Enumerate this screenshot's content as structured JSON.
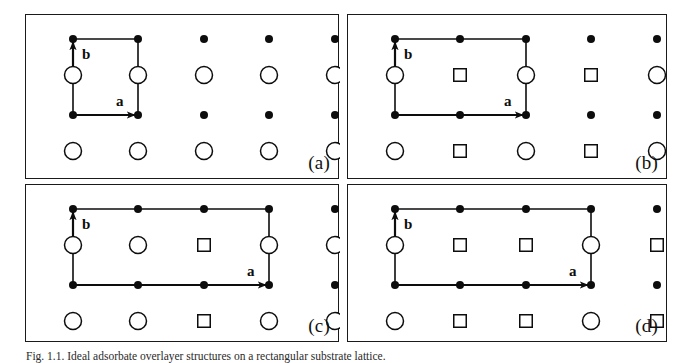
{
  "figure": {
    "caption": "Fig. 1.1. Ideal adsorbate overlayer structures on a rectangular substrate lattice.",
    "background_color": "#ffffff",
    "ink_color": "#111111",
    "panel_border_color": "#1a1a1a"
  },
  "legend_semantics": {
    "filled_dot": "substrate lattice atom",
    "open_circle": "adsorbate site type A",
    "open_square": "adsorbate site type B"
  },
  "lattice": {
    "columns": 5,
    "rows": 5,
    "row_types": [
      "dot",
      "site",
      "dot",
      "site",
      "dot"
    ],
    "x_positions": [
      47,
      112,
      178,
      243,
      309
    ],
    "y_positions": [
      24,
      60,
      100,
      136,
      170
    ],
    "dot_radius": 4.0,
    "circle_radius": 8.5,
    "square_size": 12.5
  },
  "vectors": {
    "a_label": "a",
    "b_label": "b"
  },
  "panels": [
    {
      "id": "a",
      "label": "(a)",
      "cell_cols": 1,
      "site_row_upper": [
        "circle",
        "circle",
        "circle",
        "circle",
        "circle"
      ],
      "site_row_lower": [
        "circle",
        "circle",
        "circle",
        "circle",
        "circle"
      ]
    },
    {
      "id": "b",
      "label": "(b)",
      "cell_cols": 2,
      "site_row_upper": [
        "circle",
        "square",
        "circle",
        "square",
        "circle"
      ],
      "site_row_lower": [
        "circle",
        "square",
        "circle",
        "square",
        "circle"
      ]
    },
    {
      "id": "c",
      "label": "(c)",
      "cell_cols": 3,
      "site_row_upper": [
        "circle",
        "circle",
        "square",
        "circle",
        "circle"
      ],
      "site_row_lower": [
        "circle",
        "circle",
        "square",
        "circle",
        "circle"
      ]
    },
    {
      "id": "d",
      "label": "(d)",
      "cell_cols": 3,
      "site_row_upper": [
        "circle",
        "square",
        "square",
        "circle",
        "square"
      ],
      "site_row_lower": [
        "circle",
        "square",
        "square",
        "circle",
        "square"
      ]
    }
  ],
  "panel_geometry": [
    {
      "id": "a",
      "left": 25,
      "top": 14,
      "width": 314,
      "height": 165
    },
    {
      "id": "b",
      "left": 347,
      "top": 14,
      "width": 320,
      "height": 165
    },
    {
      "id": "c",
      "left": 25,
      "top": 184,
      "width": 314,
      "height": 158
    },
    {
      "id": "d",
      "left": 347,
      "top": 184,
      "width": 320,
      "height": 158
    }
  ]
}
